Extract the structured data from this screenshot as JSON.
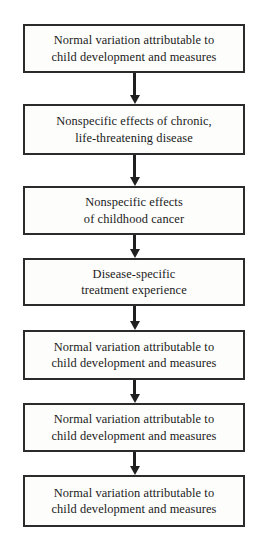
{
  "diagram": {
    "type": "flowchart",
    "orientation": "vertical",
    "title": "",
    "colors": {
      "box_border": "#2b2b2b",
      "box_fill": "#fdfdfc",
      "text": "#1a1a1a",
      "arrow": "#1f1f1f",
      "background": "#ffffff"
    },
    "nodes": [
      {
        "id": "node-1",
        "label": "Normal variation attributable to\nchild development and measures",
        "top": 24,
        "height": 49
      },
      {
        "id": "node-2",
        "label": "Nonspecific effects of chronic,\nlife-threatening disease",
        "top": 104,
        "height": 51
      },
      {
        "id": "node-3",
        "label": "Nonspecific effects\nof childhood cancer",
        "top": 186,
        "height": 49
      },
      {
        "id": "node-4",
        "label": "Disease-specific\ntreatment experience",
        "top": 258,
        "height": 48
      },
      {
        "id": "node-5",
        "label": "Normal variation attributable to\nchild development and measures",
        "top": 330,
        "height": 50
      },
      {
        "id": "node-6",
        "label": "Normal variation attributable to\nchild development and measures",
        "top": 403,
        "height": 49
      },
      {
        "id": "node-7",
        "label": "Normal variation attributable to\nchild development and measures",
        "top": 475,
        "height": 52
      }
    ],
    "connectors": [
      {
        "id": "arrow-1-2",
        "from": "node-1",
        "to": "node-2",
        "top": 73,
        "height": 31
      },
      {
        "id": "arrow-2-3",
        "from": "node-2",
        "to": "node-3",
        "top": 155,
        "height": 31
      },
      {
        "id": "arrow-3-4",
        "from": "node-3",
        "to": "node-4",
        "top": 235,
        "height": 23
      },
      {
        "id": "arrow-4-5",
        "from": "node-4",
        "to": "node-5",
        "top": 306,
        "height": 24
      },
      {
        "id": "arrow-5-6",
        "from": "node-5",
        "to": "node-6",
        "top": 380,
        "height": 23
      },
      {
        "id": "arrow-6-7",
        "from": "node-6",
        "to": "node-7",
        "top": 452,
        "height": 23
      }
    ]
  }
}
